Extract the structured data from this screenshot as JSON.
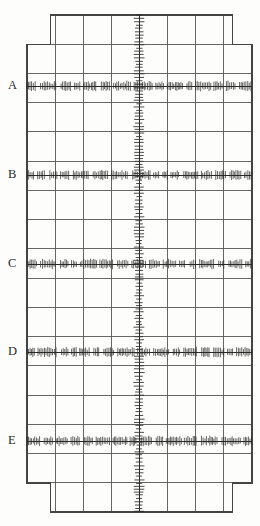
{
  "chart_data": {
    "type": "line",
    "title": "",
    "subtitle": "",
    "xlabel": "",
    "ylabel": "",
    "grid": true,
    "legend_position": "none",
    "axis_ranges": {
      "x": [
        0,
        8
      ],
      "y": [
        0,
        17
      ]
    },
    "grid_columns": 8,
    "grid_rows": 17,
    "grid_cell_width_px": 27.9,
    "grid_cell_height_px": 29.1,
    "trace_labels": [
      "A",
      "B",
      "C",
      "D",
      "E"
    ],
    "series": [
      {
        "name": "A",
        "label": "A",
        "orientation": "horizontal",
        "y_px": 86,
        "grid_row": 3,
        "x_start_px": 27,
        "x_end_px": 252,
        "amplitude_px": 4.5,
        "tick_spacing_px": 1.55,
        "values": [
          0,
          0,
          0,
          0,
          0,
          0,
          0,
          0,
          0
        ]
      },
      {
        "name": "B",
        "label": "B",
        "orientation": "horizontal",
        "y_px": 175,
        "grid_row": 6,
        "x_start_px": 27,
        "x_end_px": 252,
        "amplitude_px": 4.5,
        "tick_spacing_px": 1.55,
        "values": [
          0,
          0,
          0,
          0,
          0,
          0,
          0,
          0,
          0
        ]
      },
      {
        "name": "C",
        "label": "C",
        "orientation": "horizontal",
        "y_px": 264,
        "grid_row": 9,
        "x_start_px": 27,
        "x_end_px": 252,
        "amplitude_px": 4.5,
        "tick_spacing_px": 1.55,
        "values": [
          0,
          0,
          0,
          0,
          0,
          0,
          0,
          0,
          0
        ]
      },
      {
        "name": "D",
        "label": "D",
        "orientation": "horizontal",
        "y_px": 352,
        "grid_row": 12,
        "x_start_px": 27,
        "x_end_px": 252,
        "amplitude_px": 4.5,
        "tick_spacing_px": 1.55,
        "values": [
          0,
          0,
          0,
          0,
          0,
          0,
          0,
          0,
          0
        ]
      },
      {
        "name": "E",
        "label": "E",
        "orientation": "horizontal",
        "y_px": 441,
        "grid_row": 15,
        "x_start_px": 27,
        "x_end_px": 252,
        "amplitude_px": 4.5,
        "tick_spacing_px": 1.55,
        "values": [
          0,
          0,
          0,
          0,
          0,
          0,
          0,
          0,
          0
        ]
      },
      {
        "name": "vertical-trace",
        "label": "",
        "orientation": "vertical",
        "x_px": 139,
        "grid_column": 4,
        "y_start_px": 15,
        "y_end_px": 512,
        "amplitude_px": 4.5,
        "tick_spacing_px": 3.1,
        "values": [
          0,
          0,
          0,
          0,
          0,
          0,
          0,
          0,
          0
        ]
      }
    ]
  },
  "labels": {
    "a": "A",
    "b": "B",
    "c": "C",
    "d": "D",
    "e": "E"
  },
  "colors": {
    "background": "#fdfdfc",
    "grid_line": "#555555",
    "grid_border": "#444444",
    "trace": "#2a2a2a",
    "label_text": "#2b2b2b"
  },
  "geometry": {
    "width_px": 260,
    "height_px": 526,
    "inner_left_px": 50.2,
    "inner_right_px": 232.1,
    "outer_left_px": 27.0,
    "outer_right_px": 252.0,
    "top_px": 15.0,
    "bottom_px": 512.0,
    "step_top_px": 44.1,
    "step_bottom_px": 483.0
  }
}
